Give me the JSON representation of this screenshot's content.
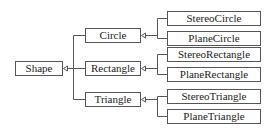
{
  "diagram": {
    "type": "class-inheritance-tree",
    "root": {
      "id": "shape",
      "label": "Shape"
    },
    "level1": [
      {
        "id": "circle",
        "label": "Circle",
        "parent": "shape"
      },
      {
        "id": "rectangle",
        "label": "Rectangle",
        "parent": "shape"
      },
      {
        "id": "triangle",
        "label": "Triangle",
        "parent": "shape"
      }
    ],
    "level2": [
      {
        "id": "stereo-circle",
        "label": "StereoCircle",
        "parent": "circle"
      },
      {
        "id": "plane-circle",
        "label": "PlaneCircle",
        "parent": "circle"
      },
      {
        "id": "stereo-rectangle",
        "label": "StereoRectangle",
        "parent": "rectangle"
      },
      {
        "id": "plane-rectangle",
        "label": "PlaneRectangle",
        "parent": "rectangle"
      },
      {
        "id": "stereo-triangle",
        "label": "StereoTriangle",
        "parent": "triangle"
      },
      {
        "id": "plane-triangle",
        "label": "PlaneTriangle",
        "parent": "triangle"
      }
    ],
    "edge_style": "hollow-triangle-arrow (inheritance)",
    "colors": {
      "stroke": "#555555",
      "text": "#222222",
      "background": "#ffffff"
    }
  }
}
